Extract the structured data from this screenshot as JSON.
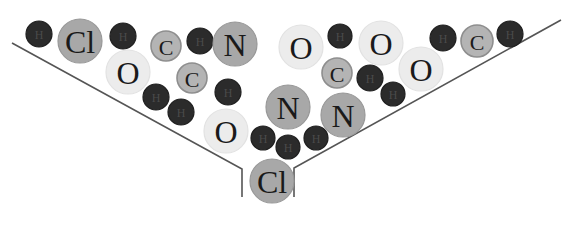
{
  "diagram": {
    "type": "funnel-of-atoms",
    "colors": {
      "background": "#ffffff",
      "funnel_line": "#555555",
      "H": {
        "fill": "#2b2b2b",
        "stroke": "#1f1f1f",
        "text": "#4a4a4a"
      },
      "C": {
        "fill": "#b4b4b4",
        "stroke": "#8e8e8e",
        "text": "#1a1a1a"
      },
      "N": {
        "fill": "#a8a8a8",
        "stroke": "#989898",
        "text": "#1a1a1a"
      },
      "Cl": {
        "fill": "#a8a8a8",
        "stroke": "#989898",
        "text": "#1a1a1a"
      },
      "O": {
        "fill": "#ececec",
        "stroke": "#e2e2e2",
        "text": "#1a1a1a"
      }
    },
    "funnel": {
      "left_path": "M12,43 L242,169 L242,197",
      "right_path": "M561,20 L294,168 L294,197"
    },
    "atoms": [
      {
        "el": "H",
        "label": "H",
        "x": 39,
        "y": 34,
        "r": 13
      },
      {
        "el": "Cl",
        "label": "Cl",
        "x": 80,
        "y": 41,
        "r": 22
      },
      {
        "el": "H",
        "label": "H",
        "x": 123,
        "y": 36,
        "r": 13
      },
      {
        "el": "C",
        "label": "C",
        "x": 166,
        "y": 46,
        "r": 15
      },
      {
        "el": "H",
        "label": "H",
        "x": 200,
        "y": 41,
        "r": 13
      },
      {
        "el": "N",
        "label": "N",
        "x": 235,
        "y": 44,
        "r": 22
      },
      {
        "el": "O",
        "label": "O",
        "x": 128,
        "y": 72,
        "r": 22
      },
      {
        "el": "C",
        "label": "C",
        "x": 192,
        "y": 78,
        "r": 15
      },
      {
        "el": "H",
        "label": "H",
        "x": 156,
        "y": 97,
        "r": 13
      },
      {
        "el": "H",
        "label": "H",
        "x": 181,
        "y": 112,
        "r": 13
      },
      {
        "el": "H",
        "label": "H",
        "x": 228,
        "y": 92,
        "r": 13
      },
      {
        "el": "O",
        "label": "O",
        "x": 301,
        "y": 47,
        "r": 22
      },
      {
        "el": "H",
        "label": "H",
        "x": 340,
        "y": 36,
        "r": 12
      },
      {
        "el": "O",
        "label": "O",
        "x": 381,
        "y": 43,
        "r": 22
      },
      {
        "el": "C",
        "label": "C",
        "x": 337,
        "y": 73,
        "r": 15
      },
      {
        "el": "H",
        "label": "H",
        "x": 370,
        "y": 78,
        "r": 13
      },
      {
        "el": "H",
        "label": "H",
        "x": 393,
        "y": 94,
        "r": 12
      },
      {
        "el": "O",
        "label": "O",
        "x": 421,
        "y": 69,
        "r": 22
      },
      {
        "el": "H",
        "label": "H",
        "x": 443,
        "y": 38,
        "r": 13
      },
      {
        "el": "C",
        "label": "C",
        "x": 477,
        "y": 41,
        "r": 16
      },
      {
        "el": "H",
        "label": "H",
        "x": 510,
        "y": 34,
        "r": 13
      },
      {
        "el": "N",
        "label": "N",
        "x": 288,
        "y": 107,
        "r": 22
      },
      {
        "el": "N",
        "label": "N",
        "x": 343,
        "y": 115,
        "r": 22
      },
      {
        "el": "O",
        "label": "O",
        "x": 226,
        "y": 131,
        "r": 22
      },
      {
        "el": "H",
        "label": "H",
        "x": 263,
        "y": 138,
        "r": 12
      },
      {
        "el": "H",
        "label": "H",
        "x": 288,
        "y": 147,
        "r": 12
      },
      {
        "el": "H",
        "label": "H",
        "x": 316,
        "y": 138,
        "r": 12
      },
      {
        "el": "Cl",
        "label": "Cl",
        "x": 272,
        "y": 181,
        "r": 22
      }
    ]
  }
}
